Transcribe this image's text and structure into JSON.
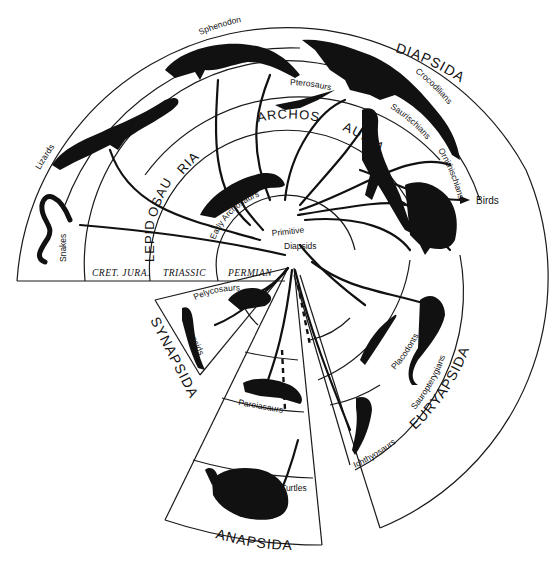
{
  "diagram": {
    "type": "radial-phylogeny",
    "groups": [
      {
        "label": "DIAPSIDA"
      },
      {
        "label": "SYNAPSIDA"
      },
      {
        "label": "ANAPSIDA"
      },
      {
        "label": "EURYAPSIDA"
      }
    ],
    "subgroups": {
      "lepidosauria": "LEPIDOSAURIA",
      "lepidosauria_part1": "LEPID",
      "lepidosauria_part2": "OSAU",
      "lepidosauria_part3": "RIA",
      "archosauria_part1": "ARCHOS",
      "archosauria_part2": "AURIA"
    },
    "eras": [
      {
        "label": "CRET. JURA."
      },
      {
        "label": "TRIASSIC"
      },
      {
        "label": "PERMIAN"
      }
    ],
    "center": {
      "line1": "Primitive",
      "line2": "Diapsids"
    },
    "taxa": {
      "snakes": "Snakes",
      "lizards": "Lizards",
      "sphenodon": "Sphenodon",
      "crocodilians": "Crocodilians",
      "pterosaurs": "Pterosaurs",
      "saurischians": "Saurischians",
      "birds": "Birds",
      "ornithischians": "Ornithischians",
      "early_archosaurs": "Early Archosaurs",
      "pelycosaurs": "Pelycosaurs",
      "therapsids": "Therapsids",
      "pareiasaurs": "Pareiasaurs",
      "turtles": "Turtles",
      "placodonts": "Placodonts",
      "sauropterygians": "Sauropterygians",
      "ichthyosaurs": "Ichthyosaurs"
    }
  }
}
